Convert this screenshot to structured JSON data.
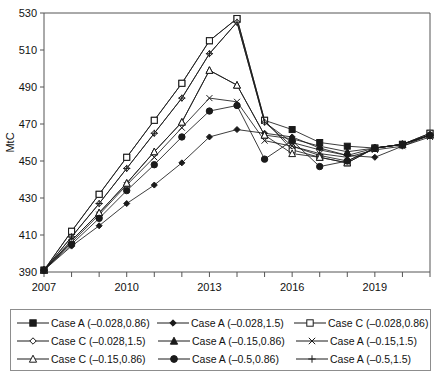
{
  "chart_data": {
    "type": "line",
    "title": "",
    "xlabel": "",
    "ylabel": "MtC",
    "xlim": [
      2007,
      2021
    ],
    "ylim": [
      390,
      530
    ],
    "ytick_step": 20,
    "yticks": [
      390,
      410,
      430,
      450,
      470,
      490,
      510,
      530
    ],
    "xticks": [
      2007,
      2008,
      2009,
      2010,
      2011,
      2012,
      2013,
      2014,
      2015,
      2016,
      2017,
      2018,
      2019,
      2020,
      2021
    ],
    "xtick_labels_shown": [
      "2007",
      "2010",
      "2013",
      "2016",
      "2019"
    ],
    "grid": false,
    "legend_position": "below",
    "x": [
      2007,
      2008,
      2009,
      2010,
      2011,
      2012,
      2013,
      2014,
      2015,
      2016,
      2017,
      2018,
      2019,
      2020,
      2021
    ],
    "series": [
      {
        "name": "Case A (–0.028,0.86)",
        "marker": "filled-square",
        "values": [
          391,
          412,
          432,
          452,
          472,
          492,
          515,
          527,
          472,
          467,
          460,
          458,
          457,
          459,
          465
        ]
      },
      {
        "name": "Case A (–0.028,1.5)",
        "marker": "filled-diamond",
        "values": [
          391,
          404,
          415,
          427,
          437,
          449,
          463,
          467,
          465,
          463,
          457,
          453,
          452,
          458,
          464
        ]
      },
      {
        "name": "Case C (–0.028,0.86)",
        "marker": "open-square",
        "values": [
          391,
          412,
          432,
          452,
          472,
          492,
          515,
          527,
          472,
          456,
          452,
          449,
          457,
          459,
          465
        ]
      },
      {
        "name": "Case C (–0.028,1.5)",
        "marker": "open-diamond",
        "values": [
          391,
          409,
          427,
          446,
          465,
          484,
          508,
          525,
          471,
          458,
          453,
          450,
          457,
          459,
          464
        ]
      },
      {
        "name": "Case A (–0.15,0.86)",
        "marker": "filled-triangle",
        "values": [
          391,
          407,
          422,
          438,
          455,
          471,
          499,
          491,
          464,
          462,
          458,
          455,
          457,
          459,
          464
        ]
      },
      {
        "name": "Case A (–0.15,1.5)",
        "marker": "x-cross",
        "values": [
          391,
          406,
          421,
          437,
          452,
          468,
          484,
          482,
          461,
          458,
          454,
          452,
          456,
          458,
          463
        ]
      },
      {
        "name": "Case C (–0.15,0.86)",
        "marker": "open-triangle",
        "values": [
          391,
          407,
          422,
          438,
          455,
          471,
          499,
          491,
          464,
          454,
          452,
          449,
          457,
          459,
          464
        ]
      },
      {
        "name": "Case A (–0.5,0.86)",
        "marker": "filled-circle",
        "values": [
          391,
          405,
          419,
          434,
          448,
          463,
          477,
          480,
          451,
          461,
          447,
          450,
          457,
          459,
          464
        ]
      },
      {
        "name": "Case A (–0.5,1.5)",
        "marker": "plus-cross",
        "values": [
          391,
          409,
          427,
          446,
          465,
          484,
          508,
          525,
          471,
          460,
          456,
          453,
          457,
          459,
          464
        ]
      }
    ]
  },
  "axes": {
    "y_label": "MtC",
    "y_tick_labels": [
      "530",
      "510",
      "490",
      "470",
      "450",
      "430",
      "410",
      "390"
    ],
    "x_tick_labels": [
      "2007",
      "2010",
      "2013",
      "2016",
      "2019"
    ]
  },
  "legend": {
    "rows": [
      [
        {
          "marker": "filled-square",
          "label": "Case A (–0.028,0.86)"
        },
        {
          "marker": "filled-diamond",
          "label": "Case A (–0.028,1.5)"
        },
        {
          "marker": "open-square",
          "label": "Case C (–0.028,0.86)"
        }
      ],
      [
        {
          "marker": "open-diamond",
          "label": "Case C (–0.028,1.5)"
        },
        {
          "marker": "filled-triangle",
          "label": "Case A (–0.15,0.86)"
        },
        {
          "marker": "x-cross",
          "label": "Case A (–0.15,1.5)"
        }
      ],
      [
        {
          "marker": "open-triangle",
          "label": "Case C (–0.15,0.86)"
        },
        {
          "marker": "filled-circle",
          "label": "Case A (–0.5,0.86)"
        },
        {
          "marker": "plus-cross",
          "label": "Case A (–0.5,1.5)"
        }
      ]
    ]
  },
  "style": {
    "line_color": "#1a1a1a",
    "frame_color": "#555555",
    "text_color": "#111111",
    "background": "#ffffff"
  }
}
